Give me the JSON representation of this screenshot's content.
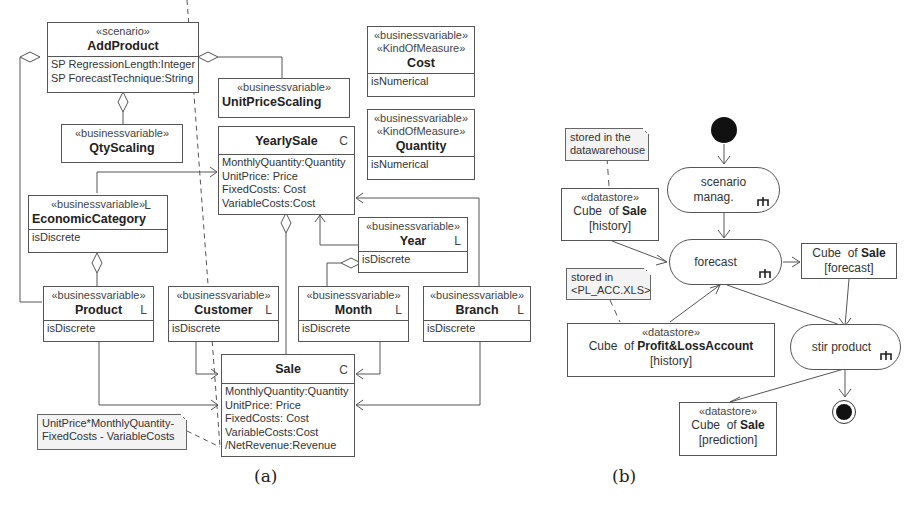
{
  "panel_a": {
    "caption": "(a)",
    "classes": {
      "add_product": {
        "stereotype": "«scenario»",
        "name": "AddProduct",
        "attrs": [
          "SP RegressionLength:Integer",
          "SP ForecastTechnique:String"
        ]
      },
      "qty_scaling": {
        "stereotype": "«businessvariable»",
        "name": "QtyScaling"
      },
      "unit_price_scaling": {
        "stereotype": "«businessvariable»",
        "name": "UnitPriceScaling"
      },
      "cost": {
        "stereotype1": "«businessvariable»",
        "stereotype2": "«KindOfMeasure»",
        "name": "Cost",
        "attrs": [
          "isNumerical"
        ]
      },
      "quantity": {
        "stereotype1": "«businessvariable»",
        "stereotype2": "«KindOfMeasure»",
        "name": "Quantity",
        "attrs": [
          "isNumerical"
        ]
      },
      "yearly_sale": {
        "name": "YearlySale",
        "marker": "C",
        "attrs": [
          "MonthlyQuantity:Quantity",
          "UnitPrice: Price",
          "FixedCosts: Cost",
          "VariableCosts:Cost"
        ]
      },
      "economic_category": {
        "stereotype": "«businessvariable»",
        "marker": "L",
        "name": "EconomicCategory",
        "attrs": [
          "isDiscrete"
        ]
      },
      "year": {
        "stereotype": "«businessvariable»",
        "name": "Year",
        "marker": "L",
        "attrs": [
          "isDiscrete"
        ]
      },
      "product": {
        "stereotype": "«businessvariable»",
        "name": "Product",
        "marker": "L",
        "attrs": [
          "isDiscrete"
        ]
      },
      "customer": {
        "stereotype": "«businessvariable»",
        "name": "Customer",
        "marker": "L",
        "attrs": [
          "isDiscrete"
        ]
      },
      "month": {
        "stereotype": "«businessvariable»",
        "name": "Month",
        "marker": "L",
        "attrs": [
          "isDiscrete"
        ]
      },
      "branch": {
        "stereotype": "«businessvariable»",
        "name": "Branch",
        "marker": "L",
        "attrs": [
          "isDiscrete"
        ]
      },
      "sale": {
        "name": "Sale",
        "marker": "C",
        "attrs": [
          "MonthlyQuantity:Quantity",
          "UnitPrice: Price",
          "FixedCosts: Cost",
          "VariableCosts:Cost",
          "/NetRevenue:Revenue"
        ]
      }
    },
    "note": {
      "lines": [
        "UnitPrice*MonthlyQuantity-",
        "FixedCosts - VariableCosts"
      ]
    }
  },
  "panel_b": {
    "caption": "(b)",
    "notes": {
      "dw": {
        "lines": [
          "stored in the",
          "datawarehouse"
        ]
      },
      "xls": {
        "lines": [
          "stored in",
          "<PL_ACC.XLS>"
        ]
      }
    },
    "actions": {
      "scenario": {
        "lines": [
          "scenario",
          "manag."
        ]
      },
      "forecast": {
        "label": "forecast"
      },
      "stir": {
        "label": "stir product"
      }
    },
    "datastores": {
      "sale_history": {
        "stereotype": "«datastore»",
        "prefix": "Cube  of ",
        "name": "Sale",
        "state": "[history]"
      },
      "pl_history": {
        "stereotype": "«datastore»",
        "prefix": "Cube  of ",
        "name": "Profit&LossAccount",
        "state": "[history]"
      },
      "sale_forecast": {
        "prefix": "Cube  of ",
        "name": "Sale",
        "state": "[forecast]"
      },
      "sale_prediction": {
        "stereotype": "«datastore»",
        "prefix": "Cube  of ",
        "name": "Sale",
        "state": "[prediction]"
      }
    }
  }
}
